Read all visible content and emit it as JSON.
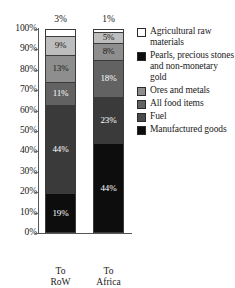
{
  "title_remnant": "",
  "chart_data": {
    "type": "bar",
    "subtype": "stacked-100-percent",
    "title": "",
    "xlabel": "",
    "ylabel": "",
    "ylim": [
      0,
      100
    ],
    "grid": false,
    "legend_position": "right",
    "categories": [
      "To RoW",
      "To Africa"
    ],
    "category_labels_multiline": [
      [
        "To RoW"
      ],
      [
        "To",
        "Africa"
      ]
    ],
    "ytick_labels": [
      "100%",
      "90%",
      "80%",
      "70%",
      "60%",
      "50%",
      "40%",
      "30%",
      "20%",
      "10%",
      "0%"
    ],
    "ytick_values": [
      100,
      90,
      80,
      70,
      60,
      50,
      40,
      30,
      20,
      10,
      0
    ],
    "series": [
      {
        "name": "Manufactured goods",
        "color": "#0d0d0d",
        "label_color": "#ffffff",
        "values": [
          19,
          44
        ],
        "value_labels": [
          "19%",
          "44%"
        ]
      },
      {
        "name": "Fuel",
        "color": "#3a3a3a",
        "label_color": "#ffffff",
        "values": [
          44,
          23
        ],
        "value_labels": [
          "44%",
          "23%"
        ]
      },
      {
        "name": "All food items",
        "color": "#626262",
        "label_color": "#ffffff",
        "values": [
          11,
          18
        ],
        "value_labels": [
          "11%",
          "18%"
        ]
      },
      {
        "name": "Ores and metals",
        "color": "#8e8e8e",
        "label_color": "#1a1a1a",
        "values": [
          13,
          8
        ],
        "value_labels": [
          "13%",
          "8%"
        ]
      },
      {
        "name": "Pearls, precious stones and non-monetary gold",
        "color": "#bdbdbd",
        "label_color": "#1a1a1a",
        "values": [
          9,
          5
        ],
        "value_labels": [
          "9%",
          "5%"
        ]
      },
      {
        "name": "Agricultural raw materials",
        "color": "#ffffff",
        "label_color": "#1a1a1a",
        "values": [
          3,
          1
        ],
        "value_labels": [
          "3%",
          "1%"
        ],
        "label_placement": "above-bar"
      }
    ],
    "bars": [
      {
        "category": "To RoW",
        "top_label": "3%",
        "stack_top_to_bottom": [
          {
            "name": "Agricultural raw materials",
            "value": 3,
            "label": "3%",
            "label_shown_in_segment": false,
            "color": "#ffffff"
          },
          {
            "name": "Pearls, precious stones and non-monetary gold",
            "value": 9,
            "label": "9%",
            "label_shown_in_segment": true,
            "color": "#bdbdbd"
          },
          {
            "name": "Ores and metals",
            "value": 13,
            "label": "13%",
            "label_shown_in_segment": true,
            "color": "#8e8e8e"
          },
          {
            "name": "All food items",
            "value": 11,
            "label": "11%",
            "label_shown_in_segment": true,
            "color": "#626262"
          },
          {
            "name": "Fuel",
            "value": 44,
            "label": "44%",
            "label_shown_in_segment": true,
            "color": "#3a3a3a"
          },
          {
            "name": "Manufactured goods",
            "value": 19,
            "label": "19%",
            "label_shown_in_segment": true,
            "color": "#0d0d0d"
          }
        ]
      },
      {
        "category": "To Africa",
        "top_label": "1%",
        "stack_top_to_bottom": [
          {
            "name": "Agricultural raw materials",
            "value": 1,
            "label": "1%",
            "label_shown_in_segment": false,
            "color": "#ffffff"
          },
          {
            "name": "Pearls, precious stones and non-monetary gold",
            "value": 5,
            "label": "5%",
            "label_shown_in_segment": true,
            "color": "#bdbdbd"
          },
          {
            "name": "Ores and metals",
            "value": 8,
            "label": "8%",
            "label_shown_in_segment": true,
            "color": "#8e8e8e"
          },
          {
            "name": "All food items",
            "value": 18,
            "label": "18%",
            "label_shown_in_segment": true,
            "color": "#626262"
          },
          {
            "name": "Fuel",
            "value": 23,
            "label": "23%",
            "label_shown_in_segment": true,
            "color": "#3a3a3a"
          },
          {
            "name": "Manufactured goods",
            "value": 44,
            "label": "44%",
            "label_shown_in_segment": true,
            "color": "#0d0d0d"
          }
        ]
      }
    ],
    "legend": [
      {
        "label": "Agricultural raw materials",
        "color": "#ffffff"
      },
      {
        "label": "Pearls, precious stones and non-monetary gold",
        "color": "#0d0d0d"
      },
      {
        "label": "Ores and metals",
        "color": "#8e8e8e"
      },
      {
        "label": "All food items",
        "color": "#626262"
      },
      {
        "label": "Fuel",
        "color": "#4a4a4a"
      },
      {
        "label": "Manufactured goods",
        "color": "#0d0d0d"
      }
    ]
  }
}
